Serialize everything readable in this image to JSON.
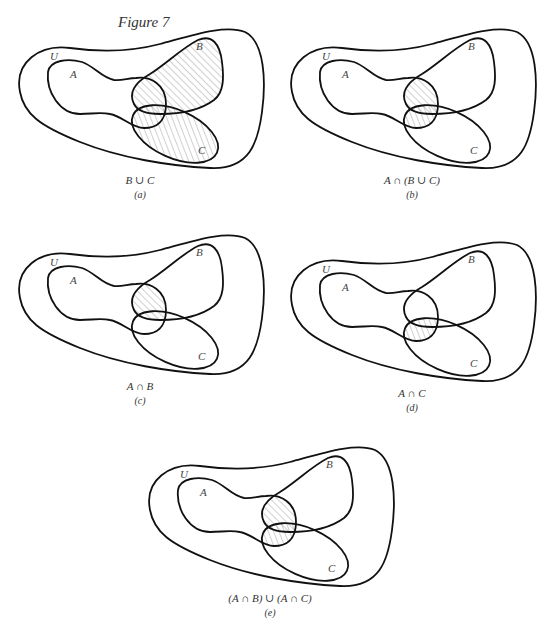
{
  "figure": {
    "title": "Figure 7"
  },
  "set_labels": {
    "universe": "U",
    "a": "A",
    "b": "B",
    "c": "C"
  },
  "colors": {
    "outline": "#111111",
    "hatch": "#8a8a8a",
    "background": "#ffffff"
  },
  "panels": [
    {
      "id": "a",
      "expression": "B ∪ C",
      "letter": "(a)",
      "shaded": "B_union_C",
      "left": 10,
      "top": 22
    },
    {
      "id": "b",
      "expression": "A ∩ (B ∪ C)",
      "letter": "(b)",
      "shaded": "A_and_B_union_C",
      "left": 282,
      "top": 22
    },
    {
      "id": "c",
      "expression": "A ∩ B",
      "letter": "(c)",
      "shaded": "A_and_B",
      "left": 10,
      "top": 228
    },
    {
      "id": "d",
      "expression": "A ∩ C",
      "letter": "(d)",
      "shaded": "A_and_C",
      "left": 282,
      "top": 235
    },
    {
      "id": "e",
      "expression": "(A ∩ B) ∪ (A ∩ C)",
      "letter": "(e)",
      "shaded": "A_and_B_union_A_and_C",
      "left": 140,
      "top": 440
    }
  ]
}
